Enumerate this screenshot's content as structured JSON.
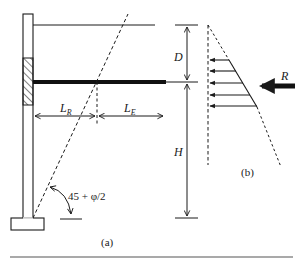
{
  "figure": {
    "panel_a": {
      "caption": "(a)",
      "labels": {
        "lr_main": "L",
        "lr_sub": "R",
        "le_main": "L",
        "le_sub": "E",
        "angle": "45 + φ/2"
      }
    },
    "panel_b": {
      "caption": "(b)",
      "labels": {
        "resultant": "R"
      }
    },
    "dimensions": {
      "depth_label": "D",
      "height_label": "H"
    }
  },
  "colors": {
    "stroke": "#1a1a1a",
    "background": "#ffffff",
    "rule": "#555555"
  }
}
